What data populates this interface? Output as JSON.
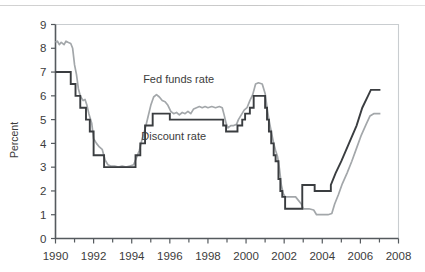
{
  "chart_data": {
    "type": "line",
    "title": "",
    "xlabel": "",
    "ylabel": "Percent",
    "xlim": [
      1990,
      2008
    ],
    "ylim": [
      0,
      9
    ],
    "grid": false,
    "legend_position": "inline-annotations",
    "x_tick_labels": [
      "1990",
      "1992",
      "1994",
      "1996",
      "1998",
      "2000",
      "2002",
      "2004",
      "2006",
      "2008"
    ],
    "x_tick_values": [
      1990,
      1992,
      1994,
      1996,
      1998,
      2000,
      2002,
      2004,
      2006,
      2008
    ],
    "x_minor_tick_values": [
      1991,
      1993,
      1995,
      1997,
      1999,
      2001,
      2003,
      2005,
      2007
    ],
    "y_tick_labels": [
      "0",
      "1",
      "2",
      "3",
      "4",
      "5",
      "6",
      "7",
      "8",
      "9"
    ],
    "y_tick_values": [
      0,
      1,
      2,
      3,
      4,
      5,
      6,
      7,
      8,
      9
    ],
    "annotations": [
      {
        "text": "Fed funds rate",
        "x": 1994.6,
        "y": 6.55,
        "series": "fed_funds_rate"
      },
      {
        "text": "Discount rate",
        "x": 1994.5,
        "y": 4.15,
        "series": "discount_rate"
      }
    ],
    "colors": {
      "discount_rate": "#3a3d40",
      "fed_funds_rate": "#a3a7aa",
      "axis": "#555a5e",
      "frame": "#c9cdd0",
      "text": "#3c3c3c",
      "background": "#ffffff"
    },
    "series": [
      {
        "name": "Discount rate",
        "color": "#3a3d40",
        "style": "step",
        "units": "percent",
        "points": [
          [
            1990.0,
            7.0
          ],
          [
            1990.8,
            7.0
          ],
          [
            1990.8,
            6.5
          ],
          [
            1991.05,
            6.5
          ],
          [
            1991.05,
            6.0
          ],
          [
            1991.3,
            6.0
          ],
          [
            1991.3,
            5.5
          ],
          [
            1991.6,
            5.5
          ],
          [
            1991.6,
            5.0
          ],
          [
            1991.8,
            5.0
          ],
          [
            1991.8,
            4.5
          ],
          [
            1992.0,
            4.5
          ],
          [
            1992.0,
            3.5
          ],
          [
            1992.55,
            3.5
          ],
          [
            1992.55,
            3.0
          ],
          [
            1994.2,
            3.0
          ],
          [
            1994.2,
            3.5
          ],
          [
            1994.45,
            3.5
          ],
          [
            1994.45,
            4.0
          ],
          [
            1994.7,
            4.0
          ],
          [
            1994.7,
            4.75
          ],
          [
            1995.1,
            4.75
          ],
          [
            1995.1,
            5.25
          ],
          [
            1996.0,
            5.25
          ],
          [
            1996.0,
            5.0
          ],
          [
            1998.8,
            5.0
          ],
          [
            1998.8,
            4.75
          ],
          [
            1998.95,
            4.75
          ],
          [
            1998.95,
            4.5
          ],
          [
            1999.55,
            4.5
          ],
          [
            1999.55,
            4.75
          ],
          [
            1999.8,
            4.75
          ],
          [
            1999.8,
            5.0
          ],
          [
            1999.95,
            5.0
          ],
          [
            1999.95,
            5.25
          ],
          [
            2000.2,
            5.25
          ],
          [
            2000.2,
            5.5
          ],
          [
            2000.4,
            5.5
          ],
          [
            2000.4,
            6.0
          ],
          [
            2001.0,
            6.0
          ],
          [
            2001.0,
            5.5
          ],
          [
            2001.1,
            5.5
          ],
          [
            2001.1,
            5.0
          ],
          [
            2001.2,
            5.0
          ],
          [
            2001.2,
            4.5
          ],
          [
            2001.32,
            4.5
          ],
          [
            2001.32,
            4.0
          ],
          [
            2001.45,
            4.0
          ],
          [
            2001.45,
            3.5
          ],
          [
            2001.55,
            3.5
          ],
          [
            2001.55,
            3.25
          ],
          [
            2001.7,
            3.25
          ],
          [
            2001.7,
            2.5
          ],
          [
            2001.8,
            2.5
          ],
          [
            2001.8,
            2.0
          ],
          [
            2001.9,
            2.0
          ],
          [
            2001.9,
            1.75
          ],
          [
            2002.05,
            1.75
          ],
          [
            2002.05,
            1.25
          ],
          [
            2002.95,
            1.25
          ],
          [
            2002.95,
            2.25
          ],
          [
            2003.6,
            2.25
          ],
          [
            2003.6,
            2.0
          ],
          [
            2004.45,
            2.0
          ],
          [
            2004.45,
            2.25
          ],
          [
            2004.7,
            2.75
          ],
          [
            2005.0,
            3.25
          ],
          [
            2005.4,
            4.0
          ],
          [
            2005.8,
            4.75
          ],
          [
            2006.1,
            5.5
          ],
          [
            2006.4,
            6.0
          ],
          [
            2006.55,
            6.25
          ],
          [
            2007.05,
            6.25
          ]
        ]
      },
      {
        "name": "Fed funds rate",
        "color": "#a3a7aa",
        "style": "monthly",
        "units": "percent",
        "points": [
          [
            1990.0,
            8.25
          ],
          [
            1990.1,
            8.3
          ],
          [
            1990.2,
            8.15
          ],
          [
            1990.3,
            8.25
          ],
          [
            1990.45,
            8.15
          ],
          [
            1990.55,
            8.3
          ],
          [
            1990.65,
            8.25
          ],
          [
            1990.8,
            8.2
          ],
          [
            1990.9,
            8.0
          ],
          [
            1991.0,
            7.3
          ],
          [
            1991.1,
            6.9
          ],
          [
            1991.2,
            6.3
          ],
          [
            1991.3,
            6.0
          ],
          [
            1991.45,
            5.8
          ],
          [
            1991.55,
            5.85
          ],
          [
            1991.65,
            5.6
          ],
          [
            1991.75,
            5.25
          ],
          [
            1991.9,
            4.85
          ],
          [
            1992.0,
            4.2
          ],
          [
            1992.15,
            4.0
          ],
          [
            1992.3,
            3.85
          ],
          [
            1992.45,
            3.75
          ],
          [
            1992.6,
            3.3
          ],
          [
            1992.75,
            3.1
          ],
          [
            1992.9,
            3.05
          ],
          [
            1993.1,
            3.05
          ],
          [
            1993.3,
            3.0
          ],
          [
            1993.5,
            3.05
          ],
          [
            1993.7,
            3.0
          ],
          [
            1993.9,
            3.05
          ],
          [
            1994.1,
            3.1
          ],
          [
            1994.25,
            3.4
          ],
          [
            1994.4,
            3.7
          ],
          [
            1994.55,
            4.2
          ],
          [
            1994.7,
            4.6
          ],
          [
            1994.85,
            5.1
          ],
          [
            1995.0,
            5.6
          ],
          [
            1995.15,
            5.95
          ],
          [
            1995.3,
            6.05
          ],
          [
            1995.45,
            5.95
          ],
          [
            1995.6,
            5.8
          ],
          [
            1995.75,
            5.75
          ],
          [
            1995.9,
            5.6
          ],
          [
            1996.05,
            5.35
          ],
          [
            1996.2,
            5.25
          ],
          [
            1996.35,
            5.3
          ],
          [
            1996.5,
            5.2
          ],
          [
            1996.65,
            5.3
          ],
          [
            1996.8,
            5.25
          ],
          [
            1996.95,
            5.35
          ],
          [
            1997.1,
            5.25
          ],
          [
            1997.25,
            5.45
          ],
          [
            1997.4,
            5.5
          ],
          [
            1997.55,
            5.55
          ],
          [
            1997.7,
            5.5
          ],
          [
            1997.85,
            5.55
          ],
          [
            1998.0,
            5.5
          ],
          [
            1998.2,
            5.55
          ],
          [
            1998.4,
            5.5
          ],
          [
            1998.6,
            5.55
          ],
          [
            1998.75,
            5.5
          ],
          [
            1998.85,
            5.2
          ],
          [
            1998.95,
            4.85
          ],
          [
            1999.05,
            4.65
          ],
          [
            1999.2,
            4.75
          ],
          [
            1999.35,
            4.75
          ],
          [
            1999.5,
            4.8
          ],
          [
            1999.6,
            5.0
          ],
          [
            1999.75,
            5.2
          ],
          [
            1999.9,
            5.4
          ],
          [
            2000.05,
            5.5
          ],
          [
            2000.2,
            5.8
          ],
          [
            2000.35,
            6.05
          ],
          [
            2000.5,
            6.5
          ],
          [
            2000.65,
            6.55
          ],
          [
            2000.85,
            6.5
          ],
          [
            2001.0,
            6.1
          ],
          [
            2001.1,
            5.5
          ],
          [
            2001.2,
            5.0
          ],
          [
            2001.32,
            4.5
          ],
          [
            2001.45,
            4.0
          ],
          [
            2001.55,
            3.7
          ],
          [
            2001.65,
            3.45
          ],
          [
            2001.75,
            2.95
          ],
          [
            2001.85,
            2.25
          ],
          [
            2001.95,
            1.9
          ],
          [
            2002.05,
            1.75
          ],
          [
            2002.3,
            1.75
          ],
          [
            2002.6,
            1.75
          ],
          [
            2002.9,
            1.45
          ],
          [
            2003.0,
            1.25
          ],
          [
            2003.3,
            1.25
          ],
          [
            2003.55,
            1.2
          ],
          [
            2003.7,
            1.0
          ],
          [
            2004.0,
            1.0
          ],
          [
            2004.3,
            1.0
          ],
          [
            2004.5,
            1.05
          ],
          [
            2004.65,
            1.45
          ],
          [
            2004.85,
            1.85
          ],
          [
            2005.05,
            2.3
          ],
          [
            2005.3,
            2.75
          ],
          [
            2005.55,
            3.25
          ],
          [
            2005.8,
            3.8
          ],
          [
            2006.05,
            4.35
          ],
          [
            2006.3,
            4.8
          ],
          [
            2006.5,
            5.15
          ],
          [
            2006.7,
            5.25
          ],
          [
            2007.05,
            5.25
          ]
        ]
      }
    ]
  }
}
